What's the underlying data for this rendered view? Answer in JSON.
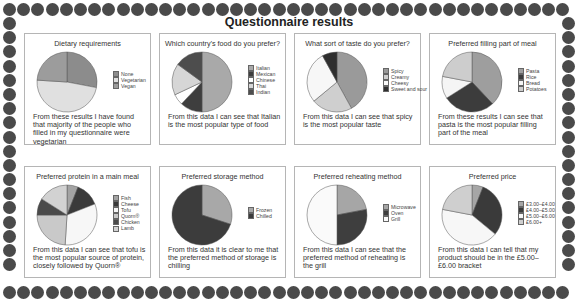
{
  "page": {
    "title": "Questionnaire results"
  },
  "chart_data": [
    {
      "type": "pie",
      "title": "Dietary requirements",
      "categories": [
        "None",
        "Vegetarian",
        "Vegan"
      ],
      "values": [
        28,
        48,
        24
      ],
      "colors": [
        "#8c8c8c",
        "#e0e0e0",
        "#9c9c9c"
      ],
      "caption": "From these results I have found that majority of the people who filled in my questionnaire were vegetarian",
      "legend_position": "right"
    },
    {
      "type": "pie",
      "title": "Which country’s  food do you prefer?",
      "categories": [
        "Italian",
        "Mexican",
        "Chinese",
        "Thai",
        "Indian"
      ],
      "values": [
        50,
        12,
        6,
        17,
        15
      ],
      "colors": [
        "#a9a9a9",
        "#3e3e3e",
        "#ffffff",
        "#d6d6d6",
        "#4d4d4d"
      ],
      "caption": "From this data I can see that Italian is the most popular type of food",
      "legend_position": "right"
    },
    {
      "type": "pie",
      "title": "What sort of taste do you prefer?",
      "categories": [
        "Spicy",
        "Creamy",
        "Cheesy",
        "Sweet and sour"
      ],
      "values": [
        42,
        22,
        28,
        8
      ],
      "colors": [
        "#9a9a9a",
        "#cfcfcf",
        "#f7f7f7",
        "#2e2e2e"
      ],
      "caption": "From this data I can see that spicy is the most popular taste",
      "legend_position": "right"
    },
    {
      "type": "pie",
      "title": "Preferred filling part of meal",
      "categories": [
        "Pasta",
        "Rice",
        "Bread",
        "Potatoes"
      ],
      "values": [
        38,
        28,
        12,
        22
      ],
      "colors": [
        "#9e9e9e",
        "#3c3c3c",
        "#f5f5f5",
        "#cdcdcd"
      ],
      "caption": "From these results I can see that pasta is the most popular filling part of the meal",
      "legend_position": "right"
    },
    {
      "type": "pie",
      "title": "Preferred protein in a main meal",
      "categories": [
        "Fish",
        "Cheese",
        "Tofu",
        "Quorn®",
        "Chicken",
        "Lamb"
      ],
      "values": [
        6,
        13,
        32,
        24,
        9,
        16
      ],
      "colors": [
        "#a3a3a3",
        "#3a3a3a",
        "#f7f7f7",
        "#c9c9c9",
        "#4a4a4a",
        "#d2d2d2"
      ],
      "caption": "From this data I can see that tofu is the most popular source of protein, closely followed by Quorn®",
      "legend_position": "right"
    },
    {
      "type": "pie",
      "title": "Preferred storage method",
      "categories": [
        "Frozen",
        "Chilled"
      ],
      "values": [
        30,
        70
      ],
      "colors": [
        "#a8a8a8",
        "#3c3c3c"
      ],
      "caption": "From this data it is clear to me that the preferred method of storage is chilling",
      "legend_position": "right"
    },
    {
      "type": "pie",
      "title": "Preferred reheating method",
      "categories": [
        "Microwave",
        "Oven",
        "Grill"
      ],
      "values": [
        22,
        28,
        50
      ],
      "colors": [
        "#a6a6a6",
        "#3e3e3e",
        "#fafafa"
      ],
      "caption": "From this data I can see that the preferred method of reheating is the grill",
      "legend_position": "right"
    },
    {
      "type": "pie",
      "title": "Preferred price",
      "categories": [
        "£3.00–£4.00",
        "£4.00–£5.00",
        "£5.00–£6.00",
        "£6.00+"
      ],
      "values": [
        6,
        30,
        42,
        22
      ],
      "colors": [
        "#a6a6a6",
        "#3a3a3a",
        "#f7f7f7",
        "#cfcfcf"
      ],
      "caption": "From this data I can tell that my product should be in the £5.00–£6.00 bracket",
      "legend_position": "right"
    }
  ]
}
